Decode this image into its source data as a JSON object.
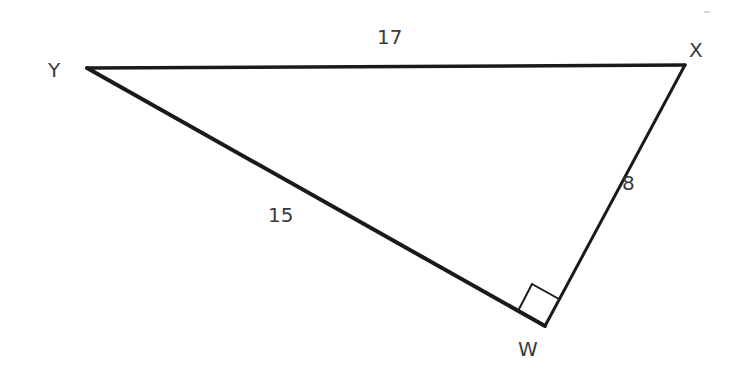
{
  "diagram": {
    "type": "right-triangle",
    "vertices": [
      {
        "label": "Y",
        "x": 87,
        "y": 68,
        "label_x": 56,
        "label_y": 77
      },
      {
        "label": "X",
        "x": 685,
        "y": 65,
        "label_x": 697,
        "label_y": 57
      },
      {
        "label": "W",
        "x": 545,
        "y": 326,
        "label_x": 531,
        "label_y": 356
      }
    ],
    "sides": [
      {
        "name": "YX",
        "length_label": "17",
        "label_x": 390,
        "label_y": 44
      },
      {
        "name": "YW",
        "length_label": "15",
        "label_x": 283,
        "label_y": 222
      },
      {
        "name": "WX",
        "length_label": "8",
        "label_x": 627,
        "label_y": 190
      }
    ],
    "right_angle_at": "W",
    "stroke_color": "#1a1a1a",
    "label_color": "#3a3a3a"
  }
}
